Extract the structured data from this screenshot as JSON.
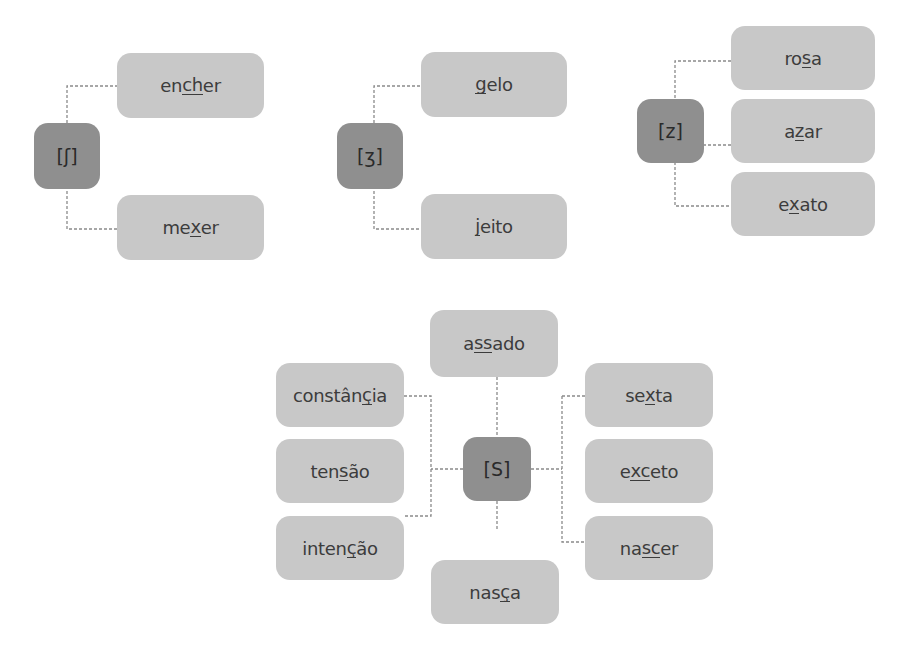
{
  "colors": {
    "hub": "#8f8f8f",
    "word_box": "#c8c8c8",
    "text": "#3c3c3c",
    "connector": "#8a8a8a"
  },
  "groups": [
    {
      "symbol": "[ʃ]",
      "words": [
        {
          "pre": "en",
          "mark": "ch",
          "post": "er",
          "full": "encher"
        },
        {
          "pre": "me",
          "mark": "x",
          "post": "er",
          "full": "mexer"
        }
      ]
    },
    {
      "symbol": "[ʒ]",
      "words": [
        {
          "pre": "",
          "mark": "g",
          "post": "elo",
          "full": "gelo"
        },
        {
          "pre": "",
          "mark": "j",
          "post": "eito",
          "full": "jeito"
        }
      ]
    },
    {
      "symbol": "[z]",
      "words": [
        {
          "pre": "ro",
          "mark": "s",
          "post": "a",
          "full": "rosa"
        },
        {
          "pre": "a",
          "mark": "z",
          "post": "ar",
          "full": "azar"
        },
        {
          "pre": "e",
          "mark": "x",
          "post": "ato",
          "full": "exato"
        }
      ]
    },
    {
      "symbol": "[S]",
      "words": [
        {
          "pre": "a",
          "mark": "ss",
          "post": "ado",
          "full": "assado"
        },
        {
          "pre": "constân",
          "mark": "ç",
          "post": "ia",
          "full": "constância"
        },
        {
          "pre": "ten",
          "mark": "s",
          "post": "ão",
          "full": "tensão"
        },
        {
          "pre": "inten",
          "mark": "ç",
          "post": "ão",
          "full": "intenção"
        },
        {
          "pre": "nas",
          "mark": "ç",
          "post": "a",
          "full": "nasça"
        },
        {
          "pre": "se",
          "mark": "x",
          "post": "ta",
          "full": "sexta"
        },
        {
          "pre": "e",
          "mark": "xc",
          "post": "eto",
          "full": "exceto"
        },
        {
          "pre": "na",
          "mark": "sc",
          "post": "er",
          "full": "nascer"
        }
      ]
    }
  ]
}
